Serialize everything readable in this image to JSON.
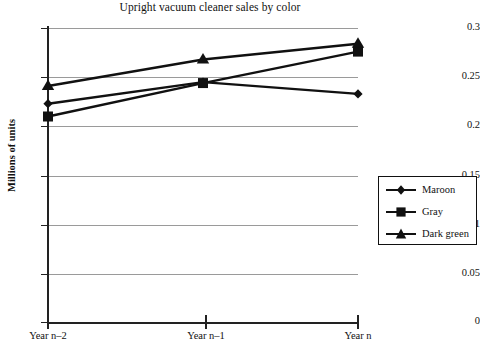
{
  "chart_data": {
    "type": "line",
    "title": "Upright vacuum cleaner sales by color",
    "xlabel": "",
    "ylabel": "Millions of units",
    "categories": [
      "Year n–2",
      "Year n–1",
      "Year n"
    ],
    "ylim": [
      0,
      0.3
    ],
    "yticks": [
      "0",
      "0.05",
      "0.1",
      "0.15",
      "0.2",
      "0.25",
      "0.3"
    ],
    "ytick_values": [
      0,
      0.05,
      0.1,
      0.15,
      0.2,
      0.25,
      0.3
    ],
    "grid": true,
    "legend_position": "right",
    "series": [
      {
        "name": "Maroon",
        "marker": "diamond",
        "color": "#111111",
        "values": [
          0.223,
          0.245,
          0.233
        ]
      },
      {
        "name": "Gray",
        "marker": "square",
        "color": "#111111",
        "values": [
          0.21,
          0.244,
          0.276
        ]
      },
      {
        "name": "Dark green",
        "marker": "triangle",
        "color": "#111111",
        "values": [
          0.241,
          0.268,
          0.284
        ]
      }
    ]
  },
  "axis": {
    "y_title": "Millions of units",
    "y_tick_labels": [
      "0.3",
      "0.25",
      "0.2",
      "0.15",
      "0.1",
      "0.05",
      "0"
    ],
    "x_tick_labels": [
      "Year n–2",
      "Year n–1",
      "Year n"
    ]
  },
  "legend": {
    "items": [
      {
        "label": "Maroon",
        "marker": "diamond-marker-icon"
      },
      {
        "label": "Gray",
        "marker": "square-marker-icon"
      },
      {
        "label": "Dark green",
        "marker": "triangle-marker-icon"
      }
    ]
  },
  "colors": {
    "ink": "#111111",
    "grid": "#9a9a9a",
    "background": "#ffffff"
  }
}
